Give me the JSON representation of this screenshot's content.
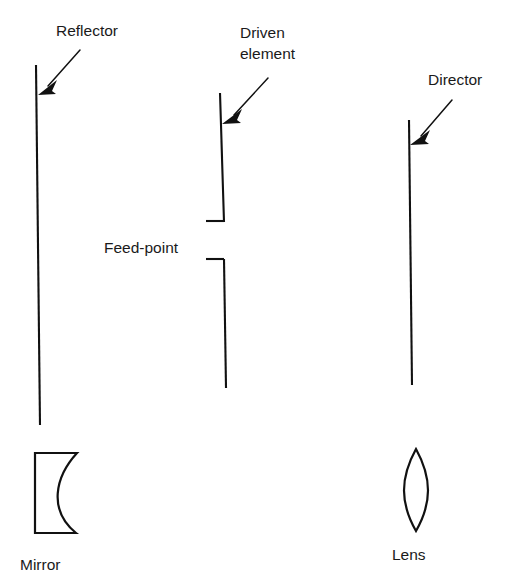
{
  "figure": {
    "background_color": "#ffffff",
    "line_color": "#111111",
    "text_color": "#1a1a1a"
  },
  "labels": {
    "reflector": "Reflector",
    "driven_element_line1": "Driven",
    "driven_element_line2": "element",
    "director": "Director",
    "feed_point": "Feed-point",
    "mirror": "Mirror",
    "lens": "Lens"
  },
  "elements": [
    {
      "name": "reflector",
      "label": "Reflector",
      "type": "vertical-element",
      "split": false,
      "x_top": 36,
      "y_top": 65,
      "x_bottom": 40,
      "y_bottom": 425
    },
    {
      "name": "driven-element",
      "label": "Driven element",
      "type": "vertical-element",
      "split": true,
      "x_top": 220,
      "y_top": 93,
      "x_bottom": 225,
      "y_bottom": 388,
      "gap_top_y": 222,
      "gap_bottom_y": 258,
      "stub_x_left": 206
    },
    {
      "name": "director",
      "label": "Director",
      "type": "vertical-element",
      "split": false,
      "x_top": 409,
      "y_top": 120,
      "x_bottom": 412,
      "y_bottom": 385
    }
  ],
  "optics": [
    {
      "name": "mirror",
      "label": "Mirror",
      "type": "concave-mirror",
      "x": 33,
      "y": 452,
      "width": 44,
      "height": 82
    },
    {
      "name": "lens",
      "label": "Lens",
      "type": "biconvex-lens",
      "x": 402,
      "y": 448,
      "width": 28,
      "height": 83
    }
  ],
  "annotations": [
    {
      "name": "reflector-arrow",
      "points_to": "reflector",
      "from_x": 80,
      "from_y": 50,
      "to_x": 39,
      "to_y": 95
    },
    {
      "name": "driven-element-arrow",
      "points_to": "driven-element",
      "from_x": 268,
      "from_y": 78,
      "to_x": 223,
      "to_y": 124
    },
    {
      "name": "director-arrow",
      "points_to": "director",
      "from_x": 452,
      "from_y": 100,
      "to_x": 411,
      "to_y": 145
    },
    {
      "name": "feed-point-leader-upper",
      "points_to": "driven-element-gap-upper"
    },
    {
      "name": "feed-point-leader-lower",
      "points_to": "driven-element-gap-lower"
    }
  ]
}
